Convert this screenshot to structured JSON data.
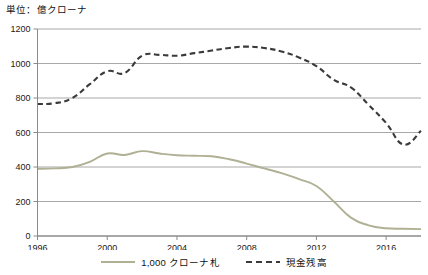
{
  "unit_label": "単位：億クローナ",
  "legend": [
    {
      "label": "1,000 クローナ札",
      "style": "solid",
      "color": "#b0b094"
    },
    {
      "label": "現金残高",
      "style": "dashed",
      "color": "#3a3a3a"
    }
  ],
  "chart_data": {
    "type": "line",
    "title": "",
    "subtitle": "",
    "xlabel": "",
    "ylabel": "単位：億クローナ",
    "xlim": [
      1996,
      2018
    ],
    "ylim": [
      0,
      1200
    ],
    "ytick_step": 200,
    "yticks": [
      0,
      200,
      400,
      600,
      800,
      1000,
      1200
    ],
    "xticks": [
      1996,
      2000,
      2004,
      2008,
      2012,
      2016
    ],
    "xtick_labels": [
      "1996",
      "2000",
      "2004",
      "2008",
      "2012",
      "2016"
    ],
    "grid": "horizontal",
    "legend_position": "bottom-center",
    "x": [
      1996,
      1997,
      1998,
      1999,
      2000,
      2001,
      2002,
      2003,
      2004,
      2005,
      2006,
      2007,
      2008,
      2009,
      2010,
      2011,
      2012,
      2013,
      2014,
      2015,
      2016,
      2017,
      2018
    ],
    "series": [
      {
        "name": "1,000 クローナ札",
        "style": "solid",
        "color": "#b0b094",
        "values": [
          390,
          392,
          400,
          430,
          478,
          470,
          492,
          478,
          468,
          465,
          462,
          445,
          420,
          392,
          365,
          330,
          290,
          200,
          105,
          62,
          45,
          42,
          40
        ]
      },
      {
        "name": "現金残高",
        "style": "dashed",
        "color": "#3a3a3a",
        "values": [
          765,
          770,
          800,
          880,
          955,
          945,
          1045,
          1050,
          1045,
          1060,
          1075,
          1090,
          1098,
          1090,
          1070,
          1035,
          985,
          905,
          860,
          760,
          655,
          530,
          610
        ]
      }
    ]
  }
}
